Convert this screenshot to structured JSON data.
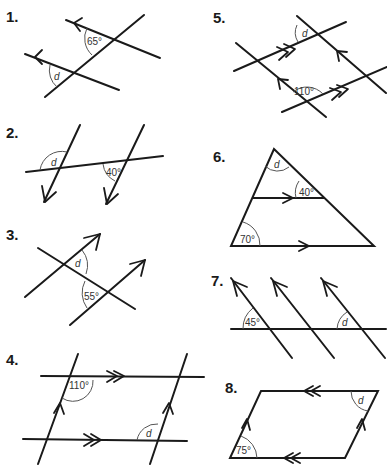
{
  "worksheet": {
    "topic": "Angles in parallel lines - find angle d",
    "questions": [
      {
        "number": "1.",
        "given_angle": "65°",
        "unknown": "d"
      },
      {
        "number": "2.",
        "given_angle": "40°",
        "unknown": "d"
      },
      {
        "number": "3.",
        "given_angle": "55°",
        "unknown": "d"
      },
      {
        "number": "4.",
        "given_angle": "110°",
        "unknown": "d"
      },
      {
        "number": "5.",
        "given_angle": "110°",
        "unknown": "d"
      },
      {
        "number": "6.",
        "given_angles": [
          "40°",
          "70°"
        ],
        "unknown": "d"
      },
      {
        "number": "7.",
        "given_angle": "45°",
        "unknown": "d"
      },
      {
        "number": "8.",
        "given_angle": "75°",
        "unknown": "d"
      }
    ]
  }
}
